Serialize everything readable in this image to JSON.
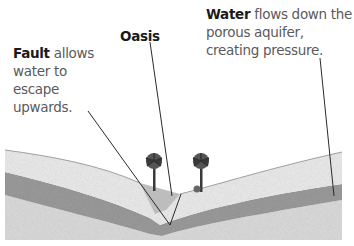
{
  "labels": {
    "fault": {
      "bold": "Fault",
      "rest": " allows water to escape upwards."
    },
    "oasis": {
      "bold": "Oasis"
    },
    "water": {
      "bold": "Water",
      "rest": " flows down the porous aquifer, creating pressure."
    }
  },
  "scene": {
    "trees": 2,
    "layers": [
      "surface-sand",
      "porous-aquifer",
      "bedrock"
    ],
    "colors": {
      "surface": "#eaeaea",
      "aquifer": "#9a9a9a",
      "bedrock": "#d8d8d8",
      "leader_line": "#2a2a2a",
      "tree": "#3a3a3a"
    }
  }
}
